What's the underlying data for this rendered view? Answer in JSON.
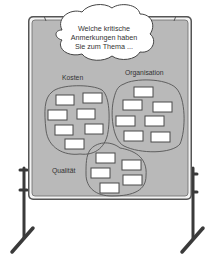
{
  "illustration": {
    "type": "pinboard-on-stand",
    "colors": {
      "board_fill": "#b9b9b9",
      "frame": "#444444",
      "card_fill": "#ffffff",
      "card_stroke": "#4a4a4a",
      "cloud_fill": "#ffffff",
      "stand": "#3a3a3a"
    },
    "question": {
      "line1": "Welche kritische",
      "line2": "Anmerkungen haben",
      "line3": "Sie zum Thema ..."
    },
    "clusters": [
      {
        "label": "Kosten",
        "card_count": 7
      },
      {
        "label": "Organisation",
        "card_count": 7
      },
      {
        "label": "Qualität",
        "card_count": 5
      }
    ]
  }
}
